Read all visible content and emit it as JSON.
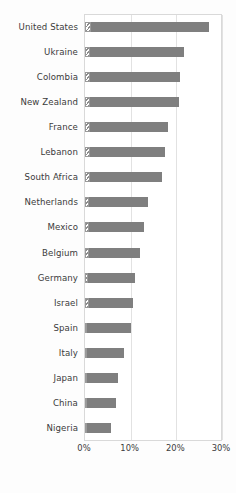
{
  "chart_data": {
    "type": "bar",
    "orientation": "horizontal",
    "title": "",
    "subtitle": "",
    "xlabel": "",
    "ylabel": "",
    "xlim": [
      0,
      30
    ],
    "xticks": [
      0,
      10,
      20,
      30
    ],
    "xtick_labels": [
      "0%",
      "10%",
      "20%",
      "30%"
    ],
    "grid": true,
    "legend": "none",
    "stacked": true,
    "categories": [
      "United States",
      "Ukraine",
      "Colombia",
      "New Zealand",
      "France",
      "Lebanon",
      "South Africa",
      "Netherlands",
      "Mexico",
      "Belgium",
      "Germany",
      "Israel",
      "Spain",
      "Italy",
      "Japan",
      "China",
      "Nigeria"
    ],
    "series": [
      {
        "name": "hatched-segment",
        "style": "diagonal-hatch",
        "values": [
          1.4,
          1.2,
          1.2,
          1.2,
          1.0,
          1.0,
          1.0,
          0.9,
          0.9,
          0.9,
          0.7,
          0.8,
          0.5,
          0.5,
          0.4,
          0.4,
          0.3
        ]
      },
      {
        "name": "solid-segment",
        "style": "solid-gray",
        "values": [
          25.8,
          20.5,
          19.6,
          19.4,
          17.1,
          16.6,
          15.9,
          12.8,
          12.0,
          11.2,
          10.2,
          9.8,
          9.6,
          8.1,
          6.8,
          6.3,
          5.3
        ]
      }
    ],
    "totals": [
      27.2,
      21.7,
      20.8,
      20.6,
      18.1,
      17.6,
      16.9,
      13.7,
      12.9,
      12.1,
      10.9,
      10.6,
      10.1,
      8.6,
      7.2,
      6.7,
      5.6
    ],
    "colors": {
      "solid": "#7f7f7f",
      "hatch_line": "#8c8c8c",
      "hatch_background": "#ffffff",
      "gridline": "#e2e2e2",
      "axis_border": "#d9d9d9",
      "label_text": "#3b3b3b",
      "figure_background": "#fdfdfd",
      "plot_background": "#ffffff"
    }
  }
}
